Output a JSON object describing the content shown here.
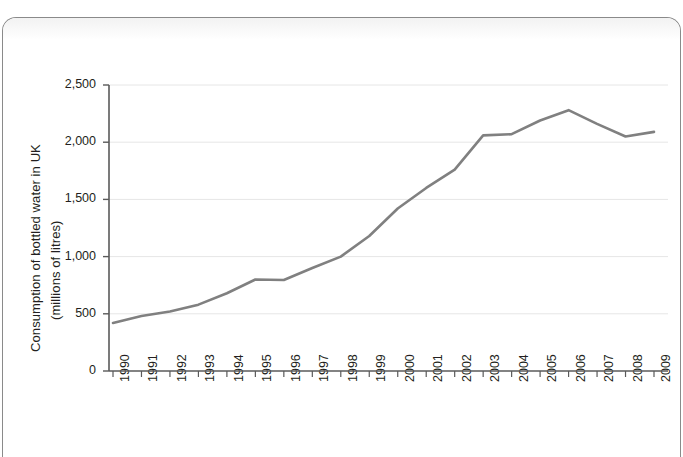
{
  "figure": {
    "frame_present": true,
    "background_color": "#ffffff"
  },
  "chart_data": {
    "type": "line",
    "title": "",
    "subtitle": "",
    "xlabel": "",
    "ylabel": "Consumption of bottled water in UK (millions of litres)",
    "ylabel_line1": "Consumption of bottled water in UK",
    "ylabel_line2": "(millions of litres)",
    "grid": true,
    "grid_axis": "y",
    "legend": false,
    "legend_position": "none",
    "line_color": "#808080",
    "grid_color": "#e6e6e6",
    "axis_color": "#5a5a5a",
    "xlim": [
      1990,
      2009
    ],
    "ylim": [
      0,
      2500
    ],
    "ytick_values": [
      0,
      500,
      1000,
      1500,
      2000,
      2500
    ],
    "ytick_labels": [
      "0",
      "500",
      "1,000",
      "1,500",
      "2,000",
      "2,500"
    ],
    "categories": [
      "1990",
      "1991",
      "1992",
      "1993",
      "1994",
      "1995",
      "1996",
      "1997",
      "1998",
      "1999",
      "2000",
      "2001",
      "2002",
      "2003",
      "2004",
      "2005",
      "2006",
      "2007",
      "2008",
      "2009"
    ],
    "x": [
      1990,
      1991,
      1992,
      1993,
      1994,
      1995,
      1996,
      1997,
      1998,
      1999,
      2000,
      2001,
      2002,
      2003,
      2004,
      2005,
      2006,
      2007,
      2008,
      2009
    ],
    "values": [
      420,
      480,
      520,
      580,
      680,
      800,
      795,
      900,
      1000,
      1180,
      1420,
      1600,
      1760,
      2060,
      2070,
      2190,
      2280,
      2160,
      2050,
      2090
    ],
    "series": [
      {
        "name": "Consumption of bottled water in UK",
        "values": [
          420,
          480,
          520,
          580,
          680,
          800,
          795,
          900,
          1000,
          1180,
          1420,
          1600,
          1760,
          2060,
          2070,
          2190,
          2280,
          2160,
          2050,
          2090
        ]
      }
    ]
  }
}
